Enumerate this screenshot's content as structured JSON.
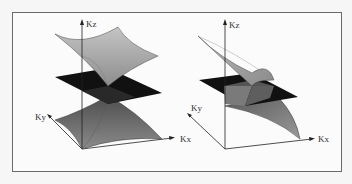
{
  "figure": {
    "panels": [
      {
        "id": "left",
        "description": "Dirac cone-like band surfaces with isotropic saddle shape intersecting a dark plane",
        "axes": {
          "kz_label": "Kz",
          "ky_label": "Ky"
        }
      },
      {
        "id": "right",
        "description": "Tilted band surfaces intersecting a dark plane",
        "axes": {
          "kz_label": "Kz",
          "ky_label": "Ky",
          "kx_label": "Kx",
          "kx_left_label": "Kx"
        }
      }
    ],
    "colors": {
      "frame": "#6a6a6a",
      "background": "#fbfbfb",
      "upper_surface": "#a9a9a9",
      "lower_surface": "#6f6f6f",
      "plane": "#111111",
      "axis": "#222222"
    }
  }
}
